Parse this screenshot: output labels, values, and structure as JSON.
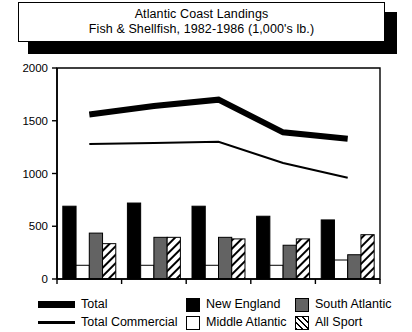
{
  "title": {
    "line1": "Atlantic Coast Landings",
    "line2": "Fish & Shellfish, 1982-1986 (1,000's lb.)"
  },
  "legend": {
    "total_label": "Total",
    "total_commercial_label": "Total Commercial",
    "new_england_label": "New England",
    "middle_atlantic_label": "Middle Atlantic",
    "south_atlantic_label": "South Atlantic",
    "all_sport_label": "All Sport"
  },
  "colors": {
    "new_england": "#000000",
    "middle_atlantic": "#ffffff",
    "south_atlantic": "#636363",
    "all_sport": "#ffffff",
    "total_line": "#000000",
    "total_commercial_line": "#000000",
    "axis": "#000000",
    "background": "#ffffff"
  },
  "chart_data": {
    "type": "bar",
    "title": "Atlantic Coast Landings\nFish & Shellfish, 1982-1986 (1,000's lb.)",
    "subtitle": "Fish & Shellfish, 1982-1986 (1,000's lb.)",
    "xlabel": "",
    "ylabel": "",
    "categories": [
      "1982",
      "1983",
      "1984",
      "1985",
      "1986"
    ],
    "x_tick_labels": [
      "1982",
      "1983",
      "1984",
      "1985",
      "1986"
    ],
    "y_tick_labels": [
      "0",
      "500",
      "1000",
      "1500",
      "2000"
    ],
    "y_ticks": [
      0,
      500,
      1000,
      1500,
      2000
    ],
    "ylim": [
      0,
      2000
    ],
    "grid": false,
    "legend_position": "bottom",
    "bar_series": [
      {
        "name": "New England",
        "values": [
          690,
          720,
          690,
          595,
          560
        ],
        "fill": "solid-black"
      },
      {
        "name": "Middle Atlantic",
        "values": [
          130,
          130,
          130,
          130,
          180
        ],
        "fill": "white"
      },
      {
        "name": "South Atlantic",
        "values": [
          435,
          395,
          395,
          320,
          230
        ],
        "fill": "gray"
      },
      {
        "name": "All Sport",
        "values": [
          335,
          395,
          380,
          380,
          420
        ],
        "fill": "diagonal-hatch"
      }
    ],
    "line_series": [
      {
        "name": "Total",
        "values": [
          1560,
          1640,
          1700,
          1390,
          1330
        ],
        "width": "thick"
      },
      {
        "name": "Total Commercial",
        "values": [
          1280,
          1290,
          1300,
          1100,
          960
        ],
        "width": "thin"
      }
    ]
  }
}
